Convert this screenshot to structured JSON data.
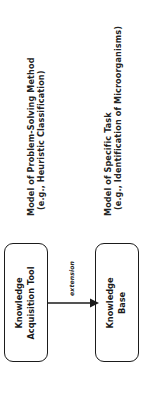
{
  "figure": {
    "orientation": "rotated-90-ccw",
    "background_color": "#ffffff",
    "line_color": "#1b1b1b"
  },
  "annotations": [
    {
      "id": "problem-solving-method",
      "line1": "Model of Problem-Solving Method",
      "line2": "(e.g., Heuristic Classification)"
    },
    {
      "id": "specific-task",
      "line1": "Model of Specific Task",
      "line2": "(e.g., Identification of Microorganisms)"
    }
  ],
  "nodes": [
    {
      "id": "knowledge-acquisition-tool",
      "line1": "Knowledge",
      "line2": "Acquisition Tool"
    },
    {
      "id": "knowledge-base",
      "line1": "Knowledge",
      "line2": "Base"
    }
  ],
  "edges": [
    {
      "id": "extension-edge",
      "label": "extension",
      "from": "knowledge-acquisition-tool",
      "to": "knowledge-base",
      "style": "solid-arrow"
    }
  ]
}
